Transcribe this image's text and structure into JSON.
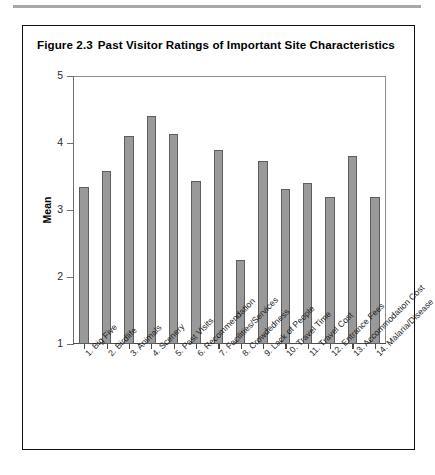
{
  "figure": {
    "number": "Figure 2.3",
    "title": "Past Visitor Ratings of Important Site Characteristics"
  },
  "colors": {
    "bar_fill": "#999999",
    "bar_border": "#5d5d5d",
    "frame": "#111111",
    "axis": "#6f6f6f",
    "top_rule": "#a8a8a8"
  },
  "chart_data": {
    "type": "bar",
    "xlabel": "",
    "ylabel": "Mean",
    "ylim": [
      1,
      5
    ],
    "yticks": [
      1,
      2,
      3,
      4,
      5
    ],
    "grid": false,
    "legend": "none",
    "categories": [
      "1. Big Five",
      "2. Birdlife",
      "3. Animals",
      "4. Scenery",
      "5. Past Visits",
      "6. Recommendation",
      "7. Facilities/Services",
      "8. Crowdedness",
      "9. Lack of People",
      "10. Travel Time",
      "11. Travel Cost",
      "12. Entrance Fees",
      "13. Accommodation Cost",
      "14. Malaria/Disease"
    ],
    "values": [
      3.35,
      3.58,
      4.11,
      4.41,
      4.43,
      4.13,
      3.43,
      3.89,
      2.26,
      3.73,
      3.31,
      3.41,
      3.19,
      3.8
    ],
    "values_corrected": [
      3.35,
      3.58,
      4.11,
      4.41,
      4.43,
      4.13,
      3.43,
      3.89,
      2.26,
      3.73,
      3.31,
      3.41,
      3.19,
      3.8,
      3.19
    ]
  },
  "chart_series_final": {
    "bars": [
      {
        "label": "1. Big Five",
        "value": 3.35
      },
      {
        "label": "2. Birdlife",
        "value": 3.58
      },
      {
        "label": "3. Animals",
        "value": 4.11
      },
      {
        "label": "4. Scenery",
        "value": 4.41
      },
      {
        "label": "5. Past Visits",
        "value": 4.13
      },
      {
        "label": "6. Recommendation",
        "value": 3.43
      },
      {
        "label": "7. Facilities/Services",
        "value": 3.89
      },
      {
        "label": "8. Crowdedness",
        "value": 2.26
      },
      {
        "label": "9. Lack of People",
        "value": 3.73
      },
      {
        "label": "10. Travel Time",
        "value": 3.31
      },
      {
        "label": "11. Travel Cost",
        "value": 3.41
      },
      {
        "label": "12. Entrance Fees",
        "value": 3.19
      },
      {
        "label": "13. Accommodation Cost",
        "value": 3.8
      },
      {
        "label": "14. Malaria/Disease",
        "value": 3.19
      }
    ]
  },
  "axis": {
    "y_title": "Mean",
    "y_tick_labels": [
      "5",
      "4",
      "3",
      "2",
      "1"
    ]
  }
}
